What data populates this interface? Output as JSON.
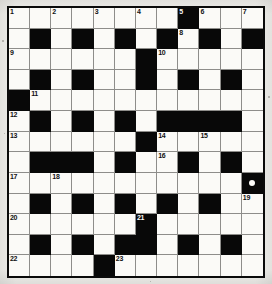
{
  "puzzle": {
    "kind": "crossword-grid",
    "columns": 12,
    "rows": 13,
    "border_color": "#0a0a0a",
    "white_cell_color": "#fbfaf7",
    "black_cell_color": "#080808",
    "page_background": "#efeeea",
    "grid_line_color": "#8e8d8a",
    "marks": [
      {
        "row": 9,
        "col": 12,
        "shape": "circle",
        "name": "white-dot-marker"
      }
    ],
    "clue_numbers": [
      {
        "n": "1",
        "row": 1,
        "col": 1
      },
      {
        "n": "2",
        "row": 1,
        "col": 3
      },
      {
        "n": "3",
        "row": 1,
        "col": 5
      },
      {
        "n": "4",
        "row": 1,
        "col": 7
      },
      {
        "n": "5",
        "row": 1,
        "col": 9
      },
      {
        "n": "6",
        "row": 1,
        "col": 10
      },
      {
        "n": "7",
        "row": 1,
        "col": 12
      },
      {
        "n": "8",
        "row": 2,
        "col": 9
      },
      {
        "n": "9",
        "row": 3,
        "col": 1
      },
      {
        "n": "10",
        "row": 3,
        "col": 8
      },
      {
        "n": "11",
        "row": 5,
        "col": 2
      },
      {
        "n": "12",
        "row": 6,
        "col": 1
      },
      {
        "n": "13",
        "row": 7,
        "col": 1
      },
      {
        "n": "14",
        "row": 7,
        "col": 8
      },
      {
        "n": "15",
        "row": 7,
        "col": 10
      },
      {
        "n": "16",
        "row": 8,
        "col": 8
      },
      {
        "n": "17",
        "row": 9,
        "col": 1
      },
      {
        "n": "18",
        "row": 9,
        "col": 3
      },
      {
        "n": "19",
        "row": 10,
        "col": 12
      },
      {
        "n": "20",
        "row": 11,
        "col": 1
      },
      {
        "n": "21",
        "row": 11,
        "col": 7
      },
      {
        "n": "22",
        "row": 13,
        "col": 1
      },
      {
        "n": "23",
        "row": 13,
        "col": 6
      }
    ],
    "grid": [
      [
        "W",
        "W",
        "W",
        "W",
        "W",
        "W",
        "W",
        "W",
        "B",
        "W",
        "W",
        "W"
      ],
      [
        "W",
        "B",
        "W",
        "B",
        "W",
        "B",
        "W",
        "B",
        "W",
        "B",
        "W",
        "B"
      ],
      [
        "W",
        "W",
        "W",
        "W",
        "W",
        "W",
        "B",
        "W",
        "W",
        "W",
        "W",
        "W"
      ],
      [
        "W",
        "B",
        "W",
        "B",
        "W",
        "W",
        "B",
        "W",
        "B",
        "W",
        "B",
        "W"
      ],
      [
        "B",
        "W",
        "W",
        "W",
        "W",
        "W",
        "W",
        "W",
        "W",
        "W",
        "W",
        "W"
      ],
      [
        "W",
        "B",
        "W",
        "B",
        "W",
        "B",
        "W",
        "B",
        "B",
        "B",
        "B",
        "W"
      ],
      [
        "W",
        "W",
        "W",
        "W",
        "W",
        "W",
        "B",
        "W",
        "W",
        "W",
        "W",
        "W"
      ],
      [
        "W",
        "B",
        "B",
        "B",
        "W",
        "B",
        "W",
        "W",
        "B",
        "W",
        "B",
        "W"
      ],
      [
        "W",
        "W",
        "W",
        "W",
        "W",
        "W",
        "W",
        "W",
        "W",
        "W",
        "W",
        "B"
      ],
      [
        "W",
        "B",
        "W",
        "B",
        "W",
        "B",
        "W",
        "B",
        "W",
        "B",
        "W",
        "W"
      ],
      [
        "W",
        "W",
        "W",
        "W",
        "W",
        "W",
        "B",
        "W",
        "W",
        "W",
        "W",
        "W"
      ],
      [
        "W",
        "B",
        "W",
        "B",
        "W",
        "B",
        "B",
        "W",
        "B",
        "W",
        "B",
        "W"
      ],
      [
        "W",
        "W",
        "W",
        "W",
        "B",
        "W",
        "W",
        "W",
        "W",
        "W",
        "W",
        "W"
      ]
    ]
  }
}
